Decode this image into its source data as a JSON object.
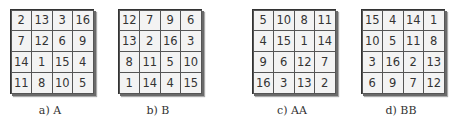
{
  "panels": [
    {
      "label": "a)  A",
      "left": 10,
      "caption_left": -10,
      "rows": [
        [
          "2",
          "13",
          "3",
          "16"
        ],
        [
          "7",
          "12",
          "6",
          "9"
        ],
        [
          "14",
          "1",
          "15",
          "4"
        ],
        [
          "11",
          "8",
          "10",
          "5"
        ]
      ]
    },
    {
      "label": "b)  B",
      "left": 118,
      "caption_left": -10,
      "rows": [
        [
          "12",
          "7",
          "9",
          "6"
        ],
        [
          "13",
          "2",
          "16",
          "3"
        ],
        [
          "8",
          "11",
          "5",
          "10"
        ],
        [
          "1",
          "14",
          "4",
          "15"
        ]
      ]
    },
    {
      "label": "c)  AA",
      "left": 252,
      "caption_left": -10,
      "rows": [
        [
          "5",
          "10",
          "8",
          "11"
        ],
        [
          "4",
          "15",
          "1",
          "14"
        ],
        [
          "9",
          "6",
          "12",
          "7"
        ],
        [
          "16",
          "3",
          "13",
          "2"
        ]
      ]
    },
    {
      "label": "d)  BB",
      "left": 361,
      "caption_left": -10,
      "rows": [
        [
          "15",
          "4",
          "14",
          "1"
        ],
        [
          "10",
          "5",
          "11",
          "8"
        ],
        [
          "3",
          "16",
          "2",
          "13"
        ],
        [
          "6",
          "9",
          "7",
          "12"
        ]
      ]
    }
  ]
}
